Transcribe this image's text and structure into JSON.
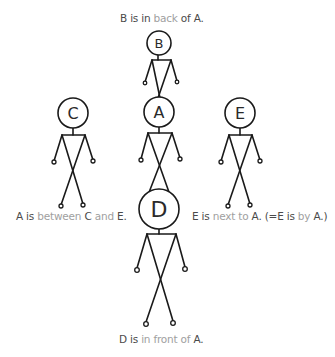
{
  "captions": {
    "top": {
      "parts": [
        "B is in ",
        "back",
        " of A."
      ]
    },
    "left": {
      "parts": [
        "A is ",
        "between",
        " C ",
        "and",
        " E."
      ]
    },
    "right": {
      "parts": [
        "E is ",
        "next to",
        " A. (=E is ",
        "by",
        " A.)"
      ]
    },
    "bottom": {
      "parts": [
        "D is ",
        "in front of",
        " A."
      ]
    }
  },
  "figures": {
    "B": {
      "label": "B"
    },
    "A": {
      "label": "A"
    },
    "C": {
      "label": "C"
    },
    "E": {
      "label": "E"
    },
    "D": {
      "label": "D"
    }
  },
  "colors": {
    "text": "#4a4a4a",
    "highlight": "#a0a0a0",
    "stroke": "#1a1a1a"
  }
}
